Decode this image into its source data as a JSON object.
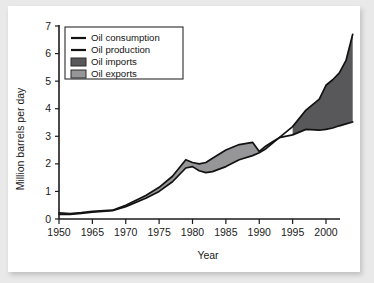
{
  "chart_data": {
    "type": "area",
    "title": "",
    "xlabel": "Year",
    "ylabel": "Million barrels per day",
    "xlim": [
      1950,
      2004
    ],
    "ylim": [
      0,
      7
    ],
    "grid": false,
    "legend_position": "top-left",
    "x_tick_labels": [
      "1950",
      "1965",
      "1970",
      "1975",
      "1980",
      "1985",
      "1990",
      "1995",
      "2000"
    ],
    "x_tick_values": [
      1950,
      1965,
      1970,
      1975,
      1980,
      1985,
      1990,
      1995,
      2000
    ],
    "y_tick_labels": [
      "0",
      "1",
      "2",
      "3",
      "4",
      "5",
      "6",
      "7"
    ],
    "y_tick_values": [
      0,
      1,
      2,
      3,
      4,
      5,
      6,
      7
    ],
    "x": [
      1950,
      1955,
      1960,
      1965,
      1968,
      1970,
      1973,
      1975,
      1977,
      1979,
      1980,
      1981,
      1982,
      1983,
      1985,
      1987,
      1989,
      1990,
      1991,
      1992,
      1993,
      1995,
      1997,
      1999,
      2000,
      2001,
      2002,
      2003,
      2004
    ],
    "series": [
      {
        "name": "Oil consumption",
        "color": "#121212",
        "values": [
          0.17,
          0.17,
          0.2,
          0.25,
          0.3,
          0.45,
          0.75,
          1.0,
          1.35,
          1.85,
          1.9,
          1.75,
          1.68,
          1.72,
          1.9,
          2.15,
          2.3,
          2.4,
          2.55,
          2.75,
          2.95,
          3.35,
          3.95,
          4.35,
          4.85,
          5.05,
          5.3,
          5.75,
          6.7
        ]
      },
      {
        "name": "Oil production",
        "color": "#121212",
        "values": [
          0.22,
          0.2,
          0.23,
          0.28,
          0.32,
          0.5,
          0.85,
          1.15,
          1.55,
          2.15,
          2.05,
          2.0,
          2.05,
          2.2,
          2.5,
          2.7,
          2.78,
          2.45,
          2.65,
          2.8,
          2.95,
          3.05,
          3.25,
          3.22,
          3.25,
          3.3,
          3.38,
          3.45,
          3.52
        ]
      }
    ],
    "bands": [
      {
        "name": "Oil imports",
        "color": "#58585a",
        "description": "Region where oil consumption exceeds oil production (after ~1992)"
      },
      {
        "name": "Oil exports",
        "color": "#969698",
        "description": "Region where oil production exceeds oil consumption (before ~1992)"
      }
    ],
    "legend": [
      {
        "label": "Oil consumption",
        "type": "line",
        "color": "#121212"
      },
      {
        "label": "Oil production",
        "type": "line",
        "color": "#121212"
      },
      {
        "label": "Oil imports",
        "type": "box",
        "color": "#58585a"
      },
      {
        "label": "Oil exports",
        "type": "box",
        "color": "#969698"
      }
    ],
    "annotations": {
      "crossover_year": 1992,
      "crossover_value": 2.9
    }
  }
}
